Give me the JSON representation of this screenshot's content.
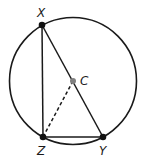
{
  "diagram": {
    "type": "geometry",
    "circle": {
      "cx": 73,
      "cy": 81,
      "r": 63.5,
      "stroke": "#1a1a1a"
    },
    "points": [
      {
        "id": "X",
        "label": "X",
        "x": 42,
        "y": 25,
        "label_x": 37,
        "label_y": 17,
        "color": "#111111"
      },
      {
        "id": "Z",
        "label": "Z",
        "x": 43,
        "y": 137,
        "label_x": 37,
        "label_y": 155,
        "color": "#111111"
      },
      {
        "id": "Y",
        "label": "Y",
        "x": 103,
        "y": 137,
        "label_x": 99,
        "label_y": 155,
        "color": "#111111"
      },
      {
        "id": "C",
        "label": "C",
        "x": 73,
        "y": 81,
        "label_x": 80,
        "label_y": 85,
        "color": "#808080"
      }
    ],
    "segments": [
      {
        "from": "X",
        "to": "Z",
        "style": "solid"
      },
      {
        "from": "Z",
        "to": "Y",
        "style": "solid"
      },
      {
        "from": "X",
        "to": "Y",
        "style": "solid"
      },
      {
        "from": "Z",
        "to": "C",
        "style": "dashed"
      }
    ]
  }
}
